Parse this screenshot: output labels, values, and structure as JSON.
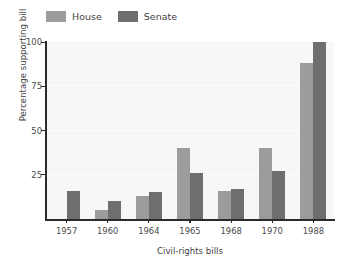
{
  "chart_data": {
    "type": "bar",
    "title": "",
    "xlabel": "Civil-rights bills",
    "ylabel": "Percentage supporting bill",
    "categories": [
      "1957",
      "1960",
      "1964",
      "1965",
      "1968",
      "1970",
      "1988"
    ],
    "series": [
      {
        "name": "House",
        "color": "#9c9c9c",
        "values": [
          0,
          5,
          13,
          40,
          16,
          40,
          88
        ]
      },
      {
        "name": "Senate",
        "color": "#6e6e6e",
        "values": [
          16,
          10,
          15,
          26,
          17,
          27,
          100
        ]
      }
    ],
    "ylim": [
      0,
      100
    ],
    "yticks": [
      "0",
      "25",
      "50",
      "75",
      "100"
    ],
    "ytick_values": [
      0,
      25,
      50,
      75,
      100
    ],
    "grid": true,
    "legend_position": "top-left",
    "plot_background": "#f7f7f7",
    "axis_color": "#2b2b2b"
  },
  "legend": {
    "entries": [
      {
        "label": "House",
        "swatch": "#9c9c9c"
      },
      {
        "label": "Senate",
        "swatch": "#6e6e6e"
      }
    ]
  }
}
